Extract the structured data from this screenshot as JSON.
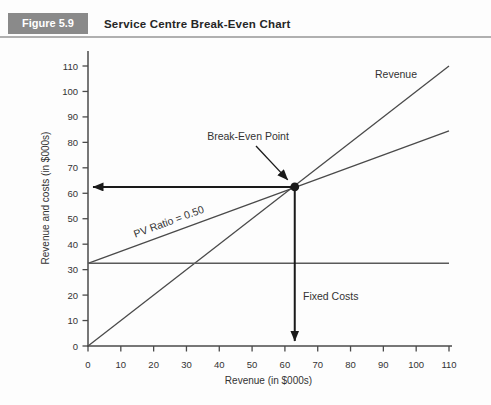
{
  "header": {
    "figure_label": "Figure 5.9",
    "title": "Service Centre Break-Even Chart"
  },
  "chart_data": {
    "type": "line",
    "title": "Service Centre Break-Even Chart",
    "xlabel": "Revenue (in $000s)",
    "ylabel": "Revenue and costs (in $000s)",
    "xlim": [
      0,
      110
    ],
    "ylim": [
      0,
      110
    ],
    "xticks": [
      0,
      10,
      20,
      30,
      40,
      50,
      60,
      70,
      80,
      90,
      100,
      110
    ],
    "yticks": [
      0,
      10,
      20,
      30,
      40,
      50,
      60,
      70,
      80,
      90,
      100,
      110
    ],
    "grid": false,
    "legend": "none",
    "series": [
      {
        "name": "Revenue",
        "label": "Revenue",
        "points": [
          [
            0,
            0
          ],
          [
            110,
            110
          ]
        ]
      },
      {
        "name": "Total costs",
        "label": "PV Ratio = 0.50",
        "points": [
          [
            0,
            32.5
          ],
          [
            110,
            84.5
          ]
        ]
      },
      {
        "name": "Fixed costs",
        "label": "Fixed Costs",
        "points": [
          [
            0,
            32.5
          ],
          [
            110,
            32.5
          ]
        ]
      }
    ],
    "break_even_point": {
      "x": 63,
      "y": 62.5,
      "label": "Break-Even Point"
    },
    "pv_ratio": 0.5,
    "fixed_costs": 32.5
  },
  "colors": {
    "badge_bg": "#8a8a8a",
    "badge_text": "#ffffff",
    "title_text": "#262626",
    "rule": "#b0b0b0",
    "axis": "#4a4a4a",
    "line": "#4a4a4a",
    "fixed_line": "#5a5a5a",
    "arrow": "#1a1a1a",
    "label_text": "#333333"
  }
}
